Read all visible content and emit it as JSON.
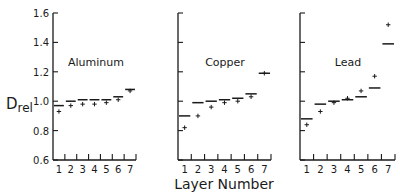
{
  "chart_data": {
    "type": "step-bar-with-points",
    "title": "",
    "xlabel": "Layer Number",
    "ylabel": "Drel",
    "ylabel_main": "D",
    "ylabel_sub": "rel",
    "ylim": [
      0.6,
      1.6
    ],
    "yticks": [
      "0.6",
      "0.8",
      "1.0",
      "1.2",
      "1.4",
      "1.6"
    ],
    "ytick_values": [
      0.6,
      0.8,
      1.0,
      1.2,
      1.4,
      1.6
    ],
    "categories": [
      "1",
      "2",
      "3",
      "4",
      "5",
      "6",
      "7"
    ],
    "grid": false,
    "legend": "none",
    "panels": [
      {
        "name": "Aluminum",
        "series": [
          {
            "name": "calculated (bars)",
            "values": [
              0.97,
              1.0,
              1.01,
              1.01,
              1.01,
              1.03,
              1.08
            ]
          },
          {
            "name": "measured (crosses)",
            "values": [
              0.93,
              0.97,
              0.98,
              0.98,
              0.99,
              1.01,
              1.07
            ]
          }
        ]
      },
      {
        "name": "Copper",
        "series": [
          {
            "name": "calculated (bars)",
            "values": [
              0.9,
              0.99,
              1.0,
              1.01,
              1.02,
              1.05,
              1.19
            ]
          },
          {
            "name": "measured (crosses)",
            "values": [
              0.82,
              0.9,
              0.96,
              0.99,
              1.0,
              1.03,
              1.19
            ]
          }
        ]
      },
      {
        "name": "Lead",
        "series": [
          {
            "name": "calculated (bars)",
            "values": [
              0.88,
              0.98,
              1.0,
              1.01,
              1.03,
              1.09,
              1.39
            ]
          },
          {
            "name": "measured (crosses)",
            "values": [
              0.84,
              0.93,
              0.99,
              1.02,
              1.07,
              1.17,
              1.52
            ]
          }
        ]
      }
    ]
  },
  "colors": {
    "ink": "#1a1a1a",
    "background": "#ffffff"
  }
}
